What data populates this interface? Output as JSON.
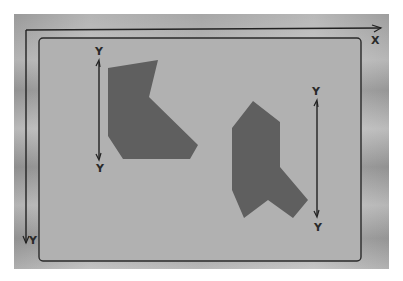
{
  "diagram": {
    "colors": {
      "panel_fill": "#b1b1b1",
      "panel_stroke": "#2a2a2a",
      "polygon_fill": "#5f5f5f",
      "axis_stroke": "#222222"
    },
    "frame_axes": {
      "x_label": "X",
      "y_label": "Y"
    },
    "shapes": [
      {
        "id": "polygon-left",
        "points": "108,68 158,60 149,97 198,145 190,159 123,159 108,136",
        "axis": {
          "top_label": "Y",
          "bottom_label": "Y",
          "x": 99,
          "y1": 62,
          "y2": 158
        }
      },
      {
        "id": "polygon-right",
        "points": "253,101 280,122 280,167 308,200 293,218 268,200 244,218 232,190 232,128",
        "axis": {
          "top_label": "Y",
          "bottom_label": "Y",
          "x": 317,
          "y1": 102,
          "y2": 215
        }
      }
    ]
  }
}
